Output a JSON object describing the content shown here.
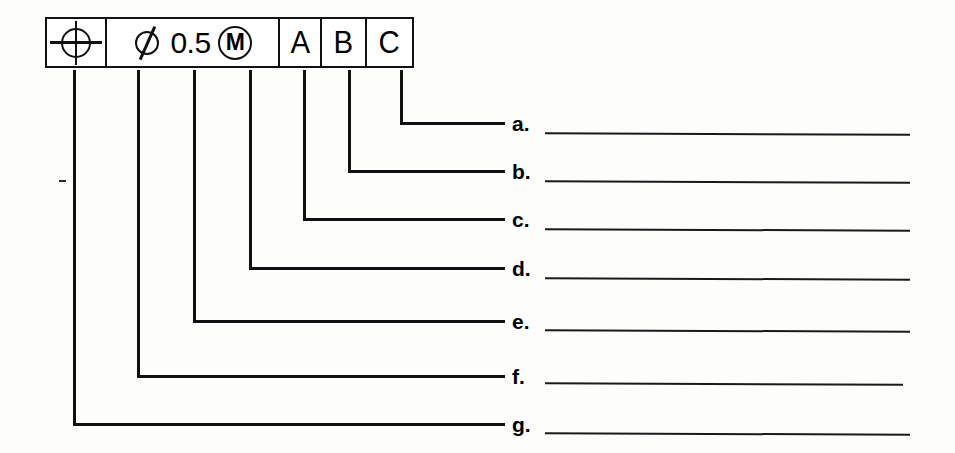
{
  "document": {
    "type": "gdt-feature-control-frame-worksheet",
    "background_color": "#fdfdfc",
    "ink_color": "#111111"
  },
  "feature_control_frame": {
    "geometric_characteristic": {
      "icon": "position-symbol",
      "name": "Position (True Position)"
    },
    "tolerance": {
      "diameter_icon": "diameter-symbol",
      "value": "0.5",
      "material_condition_icon": "mmc-circled-m-symbol",
      "material_condition_letter": "M"
    },
    "datum_references": [
      {
        "letter": "A"
      },
      {
        "letter": "B"
      },
      {
        "letter": "C"
      }
    ]
  },
  "callouts": [
    {
      "id": "a",
      "label": "a.",
      "answer": ""
    },
    {
      "id": "b",
      "label": "b.",
      "answer": ""
    },
    {
      "id": "c",
      "label": "c.",
      "answer": ""
    },
    {
      "id": "d",
      "label": "d.",
      "answer": ""
    },
    {
      "id": "e",
      "label": "e.",
      "answer": ""
    },
    {
      "id": "f",
      "label": "f.",
      "answer": ""
    },
    {
      "id": "g",
      "label": "g.",
      "answer": ""
    }
  ]
}
